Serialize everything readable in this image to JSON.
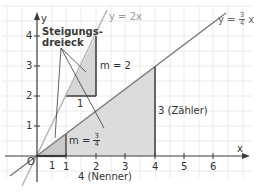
{
  "diagram": {
    "axes": {
      "x_label": "x",
      "y_label": "y",
      "origin_label": "O",
      "x_ticks": [
        "1",
        "2",
        "3",
        "4",
        "5",
        "6"
      ],
      "y_ticks": [
        "1",
        "2",
        "3",
        "4"
      ]
    },
    "lines": [
      {
        "name": "y = 2x",
        "label": "y = 2x",
        "slope": 2,
        "color": "#b5b5b5"
      },
      {
        "name": "y = 3/4 x",
        "label_prefix": "y = ",
        "label_num": "3",
        "label_den": "4",
        "label_suffix": " x",
        "slope": 0.75,
        "color": "#7a7a7a"
      }
    ],
    "annotations": {
      "title_line1": "Steigungs-",
      "title_line2": "dreieck",
      "m2_label": "m = 2",
      "m2_run_label": "1",
      "m34_prefix": "m = ",
      "m34_num": "3",
      "m34_den": "4",
      "small_run_label": "1",
      "big_rise_label": "3 (Zähler)",
      "big_run_label": "4 (Nenner)"
    },
    "colors": {
      "grid": "#e4e4e4",
      "axis": "#3a3a3a",
      "triangle_fill": "#dcdcdc",
      "triangle_edge": "#3a3a3a"
    }
  }
}
